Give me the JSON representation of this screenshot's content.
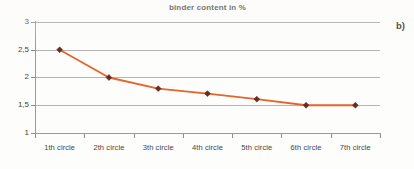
{
  "panel": {
    "label": "b)"
  },
  "chart_data": {
    "type": "line",
    "title": "binder content in %",
    "xlabel": "",
    "ylabel": "",
    "categories": [
      "1th circle",
      "2th circle",
      "3th circle",
      "4th circle",
      "5th circle",
      "6th circle",
      "7th circle"
    ],
    "values": [
      2.5,
      2.0,
      1.8,
      1.71,
      1.61,
      1.5,
      1.5
    ],
    "ylim": [
      1,
      3
    ],
    "yticks": [
      1,
      1.5,
      2,
      2.5,
      3
    ],
    "ytick_labels": [
      "1",
      "1,5",
      "2",
      "2,5",
      "3"
    ],
    "grid": true,
    "legend": false,
    "series_name": "binder content in %",
    "line_color": "#E2662B",
    "marker_color": "#6B2B20",
    "marker_shape": "diamond"
  }
}
